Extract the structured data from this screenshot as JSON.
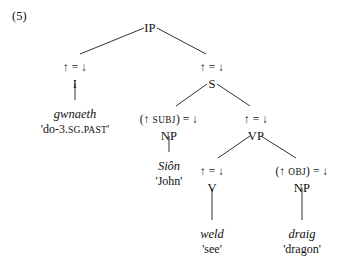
{
  "example": {
    "number": "(5)"
  },
  "tree": {
    "nodes": [
      {
        "id": "ip",
        "label": "IP",
        "x": 150,
        "y": 22
      },
      {
        "id": "i",
        "label": "I",
        "x": 75,
        "y": 78
      },
      {
        "id": "s",
        "label": "S",
        "x": 212,
        "y": 78
      },
      {
        "id": "np-subj",
        "label": "NP",
        "x": 169,
        "y": 130
      },
      {
        "id": "vp",
        "label": "VP",
        "x": 256,
        "y": 130
      },
      {
        "id": "v",
        "label": "V",
        "x": 212,
        "y": 182
      },
      {
        "id": "np-obj",
        "label": "NP",
        "x": 302,
        "y": 182
      }
    ],
    "annotations": [
      {
        "id": "annot-i",
        "parts": [
          "↑ = ↓"
        ],
        "x": 75,
        "y": 62
      },
      {
        "id": "annot-s",
        "parts": [
          "↑ = ↓"
        ],
        "x": 212,
        "y": 62
      },
      {
        "id": "annot-np-subj",
        "parts": [
          "(↑ ",
          "SUBJ",
          ") = ↓"
        ],
        "x": 169,
        "y": 114
      },
      {
        "id": "annot-vp",
        "parts": [
          "↑ = ↓"
        ],
        "x": 256,
        "y": 114
      },
      {
        "id": "annot-v",
        "parts": [
          "↑ = ↓"
        ],
        "x": 212,
        "y": 166
      },
      {
        "id": "annot-np-obj",
        "parts": [
          "(↑ ",
          "OBJ",
          ") = ↓"
        ],
        "x": 302,
        "y": 166
      }
    ],
    "leaves": [
      {
        "id": "leaf-gwnaeth",
        "word": "gwnaeth",
        "gloss_parts": [
          "'do-3.",
          "SG",
          ".",
          "PAST",
          "'"
        ],
        "x": 75,
        "word_y": 108,
        "gloss_y": 123
      },
      {
        "id": "leaf-sion",
        "word": "Siôn",
        "gloss_parts": [
          "'John'"
        ],
        "x": 169,
        "word_y": 160,
        "gloss_y": 175
      },
      {
        "id": "leaf-weld",
        "word": "weld",
        "gloss_parts": [
          "'see'"
        ],
        "x": 212,
        "word_y": 228,
        "gloss_y": 243
      },
      {
        "id": "leaf-draig",
        "word": "draig",
        "gloss_parts": [
          "'dragon'"
        ],
        "x": 302,
        "word_y": 228,
        "gloss_y": 243
      }
    ],
    "edges": [
      {
        "id": "edge-ip-i",
        "x1": 144,
        "y1": 28,
        "x2": 80,
        "y2": 54
      },
      {
        "id": "edge-ip-s",
        "x1": 157,
        "y1": 28,
        "x2": 206,
        "y2": 54
      },
      {
        "id": "edge-s-np",
        "x1": 207,
        "y1": 84,
        "x2": 176,
        "y2": 106
      },
      {
        "id": "edge-s-vp",
        "x1": 217,
        "y1": 84,
        "x2": 250,
        "y2": 106
      },
      {
        "id": "edge-vp-v",
        "x1": 250,
        "y1": 136,
        "x2": 218,
        "y2": 158
      },
      {
        "id": "edge-vp-np",
        "x1": 261,
        "y1": 136,
        "x2": 296,
        "y2": 158
      },
      {
        "id": "edge-i-gwnaeth",
        "x1": 75,
        "y1": 84,
        "x2": 75,
        "y2": 100
      },
      {
        "id": "edge-np-sion",
        "x1": 169,
        "y1": 136,
        "x2": 169,
        "y2": 152
      },
      {
        "id": "edge-v-weld",
        "x1": 212,
        "y1": 188,
        "x2": 212,
        "y2": 220
      },
      {
        "id": "edge-npobj-draig",
        "x1": 302,
        "y1": 188,
        "x2": 302,
        "y2": 220
      }
    ],
    "line_color": "#1a1a1a"
  }
}
